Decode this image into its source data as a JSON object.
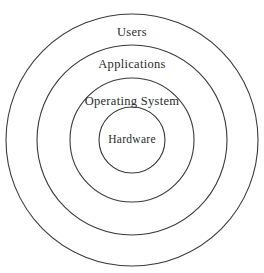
{
  "diagram": {
    "type": "concentric-circles",
    "title": "",
    "background_color": "#ffffff",
    "stroke_color": "#3a3a3a",
    "text_color": "#2b2b2b",
    "center": {
      "x": 132,
      "y": 140
    },
    "layers": [
      {
        "id": "users",
        "label": "Users",
        "radius": 126,
        "label_position": {
          "x": 132,
          "y": 26
        },
        "level": 4
      },
      {
        "id": "applications",
        "label": "Applications",
        "radius": 95,
        "label_position": {
          "x": 132,
          "y": 58
        },
        "level": 3
      },
      {
        "id": "operating-system",
        "label": "Operating System",
        "radius": 62,
        "label_position": {
          "x": 132,
          "y": 95
        },
        "level": 2
      },
      {
        "id": "hardware",
        "label": "Hardware",
        "radius": 33,
        "label_position": {
          "x": 132,
          "y": 134
        },
        "level": 1
      }
    ]
  }
}
